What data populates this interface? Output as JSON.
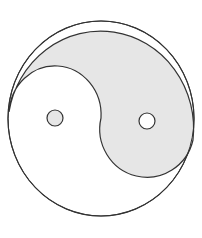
{
  "figure": {
    "label": "Yin-yang symbol",
    "colors": {
      "background": "#ffffff",
      "shaded": "#e6e6e6",
      "light": "#ffffff",
      "stroke": "#333333"
    },
    "outer": {
      "cx": 101,
      "cy": 118.5,
      "rx": 93,
      "ry": 97.5
    },
    "dots": [
      {
        "name": "shaded-dot-in-light-half",
        "cx": 55,
        "cy": 118,
        "r": 8,
        "fill": "#e6e6e6"
      },
      {
        "name": "light-dot-in-shaded-half",
        "cx": 147,
        "cy": 121,
        "r": 8,
        "fill": "#ffffff"
      }
    ]
  }
}
